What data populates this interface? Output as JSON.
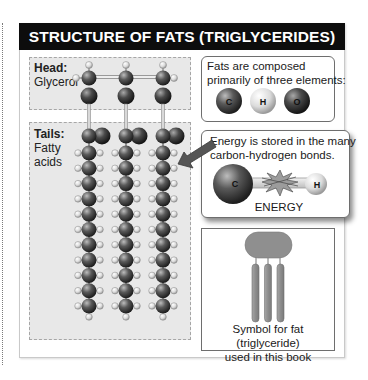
{
  "title": "STRUCTURE OF FATS (TRIGLYCERIDES)",
  "head_section": {
    "label_bold": "Head:",
    "label": "Glycerol"
  },
  "tails_section": {
    "label_bold": "Tails:",
    "label_line1": "Fatty",
    "label_line2": "acids",
    "chains": 3,
    "ch2_units_per_chain": 11
  },
  "elements_box": {
    "line1": "Fats are composed",
    "line2": "primarily of three elements:",
    "elements": [
      "C",
      "H",
      "O"
    ]
  },
  "energy_box": {
    "line1": "Energy is stored in the many",
    "line2": "carbon-hydrogen bonds.",
    "atom_left": "C",
    "atom_right": "H",
    "caption": "ENERGY"
  },
  "symbol_box": {
    "line1": "Symbol for fat (triglyceride)",
    "line2": "used in this book"
  },
  "colors": {
    "title_bg": "#0d0d0d",
    "carbon": "#4a4a4a",
    "oxygen": "#3a3a3a",
    "hydrogen": "#e0e0e0",
    "panel_bg": "#e8e8e8",
    "symbol_fill": "#8f8f8f"
  }
}
